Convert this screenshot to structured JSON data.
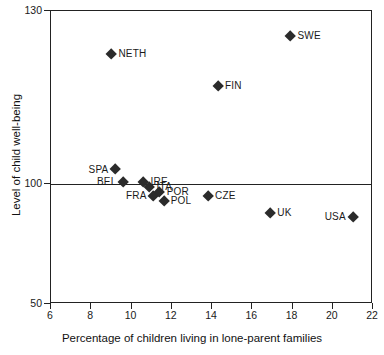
{
  "chart_data": {
    "type": "scatter",
    "title": "",
    "xlabel": "Percentage of children living in lone-parent families",
    "ylabel": "Level of child well-being",
    "xlim": [
      6,
      22
    ],
    "ylim": [
      50,
      130
    ],
    "xticks": [
      6,
      8,
      10,
      12,
      14,
      16,
      18,
      20,
      22
    ],
    "yticks": [
      50,
      100,
      130
    ],
    "grid": false,
    "legend": "none",
    "reference_lines": [
      {
        "axis": "y",
        "value": 100
      }
    ],
    "point_labels": [
      "NETH",
      "SWE",
      "FIN",
      "SPA",
      "BEL",
      "IRE",
      "ITA",
      "POR",
      "FRA",
      "POL",
      "CZE",
      "UK",
      "USA"
    ],
    "x": [
      9.0,
      17.9,
      14.3,
      9.2,
      9.6,
      10.6,
      10.9,
      11.4,
      11.1,
      11.6,
      13.8,
      16.9,
      21.0
    ],
    "y": [
      122.5,
      125.6,
      117.0,
      102.5,
      100.3,
      100.3,
      98.8,
      96.6,
      94.9,
      93.0,
      94.8,
      88.0,
      86.2
    ],
    "points": [
      {
        "label": "NETH",
        "x": 9.0,
        "y": 122.5,
        "label_side": "right"
      },
      {
        "label": "SWE",
        "x": 17.9,
        "y": 125.6,
        "label_side": "right"
      },
      {
        "label": "FIN",
        "x": 14.3,
        "y": 117.0,
        "label_side": "right"
      },
      {
        "label": "SPA",
        "x": 9.2,
        "y": 102.5,
        "label_side": "left"
      },
      {
        "label": "BEL",
        "x": 9.6,
        "y": 100.3,
        "label_side": "left"
      },
      {
        "label": "IRE",
        "x": 10.6,
        "y": 100.3,
        "label_side": "right"
      },
      {
        "label": "ITA",
        "x": 10.9,
        "y": 98.8,
        "label_side": "right"
      },
      {
        "label": "POR",
        "x": 11.4,
        "y": 96.6,
        "label_side": "right"
      },
      {
        "label": "FRA",
        "x": 11.1,
        "y": 94.9,
        "label_side": "left"
      },
      {
        "label": "POL",
        "x": 11.6,
        "y": 93.0,
        "label_side": "right"
      },
      {
        "label": "CZE",
        "x": 13.8,
        "y": 94.8,
        "label_side": "right"
      },
      {
        "label": "UK",
        "x": 16.9,
        "y": 88.0,
        "label_side": "right"
      },
      {
        "label": "USA",
        "x": 21.0,
        "y": 86.2,
        "label_side": "left"
      }
    ],
    "marker": {
      "shape": "diamond",
      "color": "#2b2b2b",
      "size": 8
    },
    "axis_color": "#222222",
    "background": "#ffffff"
  },
  "axes": {
    "x_tick_labels": [
      "6",
      "8",
      "10",
      "12",
      "14",
      "16",
      "18",
      "20",
      "22"
    ],
    "y_tick_labels": [
      "130",
      "100",
      "50"
    ],
    "x_title": "Percentage of children living in lone-parent families",
    "y_title": "Level of child well-being"
  }
}
